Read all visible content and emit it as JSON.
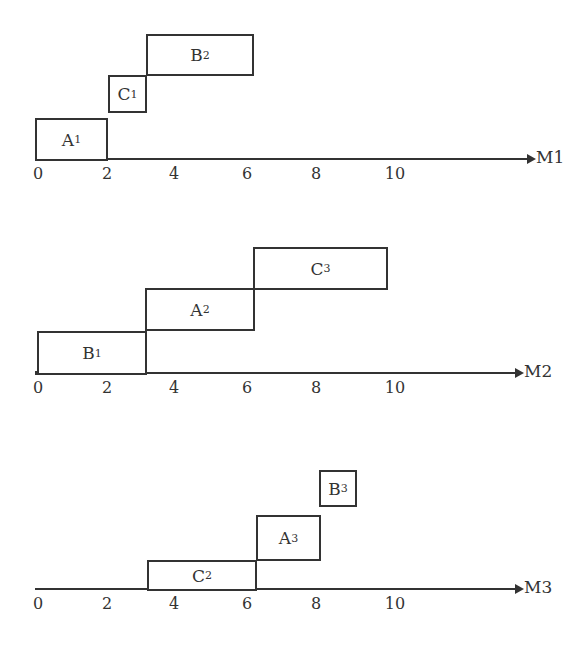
{
  "diagram": {
    "type": "gantt",
    "machines": [
      {
        "label": "M1",
        "axis_y": 159,
        "axis_x0": 35,
        "axis_x1": 527,
        "bold_x1": 107,
        "tick_y": 164,
        "tasks": [
          {
            "job": "A",
            "sub": "1",
            "start": 0,
            "end": 2,
            "x": 35,
            "y": 118,
            "w": 73,
            "h": 43
          },
          {
            "job": "C",
            "sub": "1",
            "start": 2,
            "end": 3,
            "x": 108,
            "y": 75,
            "w": 39,
            "h": 38
          },
          {
            "job": "B",
            "sub": "2",
            "start": 3,
            "end": 6,
            "x": 146,
            "y": 34,
            "w": 108,
            "h": 42
          }
        ]
      },
      {
        "label": "M2",
        "axis_y": 373,
        "axis_x0": 35,
        "axis_x1": 515,
        "bold_x1": 146,
        "tick_y": 378,
        "tasks": [
          {
            "job": "B",
            "sub": "1",
            "start": 0,
            "end": 3,
            "x": 37,
            "y": 331,
            "w": 110,
            "h": 44
          },
          {
            "job": "A",
            "sub": "2",
            "start": 3,
            "end": 6,
            "x": 145,
            "y": 288,
            "w": 110,
            "h": 43
          },
          {
            "job": "C",
            "sub": "3",
            "start": 6,
            "end": 10,
            "x": 253,
            "y": 247,
            "w": 135,
            "h": 43
          }
        ]
      },
      {
        "label": "M3",
        "axis_y": 589,
        "axis_x0": 35,
        "axis_x1": 515,
        "bold_x1": 0,
        "tick_y": 594,
        "tasks": [
          {
            "job": "C",
            "sub": "2",
            "start": 3,
            "end": 6,
            "x": 147,
            "y": 560,
            "w": 110,
            "h": 31
          },
          {
            "job": "A",
            "sub": "3",
            "start": 6,
            "end": 8,
            "x": 256,
            "y": 515,
            "w": 65,
            "h": 46
          },
          {
            "job": "B",
            "sub": "3",
            "start": 8,
            "end": 9,
            "x": 319,
            "y": 470,
            "w": 38,
            "h": 37
          }
        ]
      }
    ],
    "ticks": [
      {
        "label": "0",
        "x": 38
      },
      {
        "label": "2",
        "x": 107
      },
      {
        "label": "4",
        "x": 174
      },
      {
        "label": "6",
        "x": 247
      },
      {
        "label": "8",
        "x": 316
      },
      {
        "label": "10",
        "x": 395
      }
    ]
  }
}
